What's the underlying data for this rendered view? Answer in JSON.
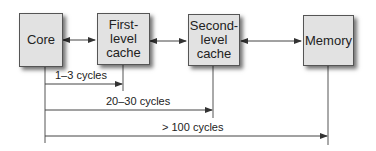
{
  "diagram": {
    "nodes": [
      {
        "id": "core",
        "label": "Core"
      },
      {
        "id": "l1",
        "label": "First-\nlevel\ncache"
      },
      {
        "id": "l2",
        "label": "Second-\nlevel\ncache"
      },
      {
        "id": "memory",
        "label": "Memory"
      }
    ],
    "edges": [
      {
        "from": "core",
        "to": "l1",
        "type": "bidirectional"
      },
      {
        "from": "l1",
        "to": "l2",
        "type": "bidirectional"
      },
      {
        "from": "l2",
        "to": "memory",
        "type": "bidirectional"
      }
    ],
    "latencies": [
      {
        "from": "core",
        "to": "l1",
        "label": "1–3 cycles"
      },
      {
        "from": "core",
        "to": "l2",
        "label": "20–30 cycles"
      },
      {
        "from": "core",
        "to": "memory",
        "label": "> 100 cycles"
      }
    ],
    "colors": {
      "box_fill": "#e2e2e2",
      "line": "#444444"
    }
  }
}
